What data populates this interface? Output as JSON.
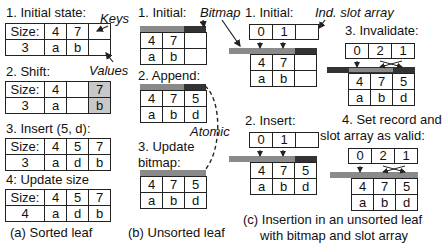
{
  "colors": {
    "bitmap_valid": "#8a8a8a",
    "bitmap_invalid": "#333333",
    "shifted_cell": "#c8c8c8"
  },
  "sorted": {
    "caption": "(a) Sorted leaf",
    "annot_keys": "Keys",
    "annot_values": "Values",
    "steps": [
      {
        "label": "1. Initial state:",
        "size_label": "Size:",
        "size": "3",
        "keys": [
          "4",
          "7",
          ""
        ],
        "values": [
          "a",
          "b",
          ""
        ]
      },
      {
        "label": "2. Shift:",
        "size_label": "Size:",
        "size": "3",
        "keys": [
          "4",
          "",
          "7"
        ],
        "values": [
          "a",
          "",
          "b"
        ]
      },
      {
        "label": "3. Insert (5, d):",
        "size_label": "Size:",
        "size": "3",
        "keys": [
          "4",
          "5",
          "7"
        ],
        "values": [
          "a",
          "d",
          "b"
        ]
      },
      {
        "label": "4: Update size",
        "size_label": "Size:",
        "size": "4",
        "keys": [
          "4",
          "5",
          "7"
        ],
        "values": [
          "a",
          "d",
          "b"
        ]
      }
    ]
  },
  "unsorted": {
    "caption": "(b) Unsorted leaf",
    "annot_bitmap": "Bitmap",
    "annot_atomic": "Atomic",
    "steps": [
      {
        "label": "1. Initial:",
        "keys": [
          "4",
          "7",
          ""
        ],
        "values": [
          "a",
          "b",
          ""
        ]
      },
      {
        "label": "2. Append:",
        "keys": [
          "4",
          "7",
          "5"
        ],
        "values": [
          "a",
          "b",
          "d"
        ]
      },
      {
        "label_line1": "3. Update",
        "label_line2": "bitmap:",
        "keys": [
          "4",
          "7",
          "5"
        ],
        "values": [
          "a",
          "b",
          "d"
        ]
      }
    ]
  },
  "slot": {
    "caption_line1": "(c) Insertion in an unsorted leaf",
    "caption_line2": "with bitmap and slot array",
    "annot_slot": "Ind. slot array",
    "steps": [
      {
        "label": "1. Initial:",
        "slots": [
          "0",
          "1",
          ""
        ],
        "keys": [
          "4",
          "7",
          ""
        ],
        "values": [
          "a",
          "b",
          ""
        ]
      },
      {
        "label": "2. Insert:",
        "slots": [
          "0",
          "1",
          ""
        ],
        "keys": [
          "4",
          "7",
          "5"
        ],
        "values": [
          "a",
          "b",
          "d"
        ]
      },
      {
        "label": "3. Invalidate:",
        "slots": [
          "0",
          "2",
          "1"
        ],
        "keys": [
          "4",
          "7",
          "5"
        ],
        "values": [
          "a",
          "b",
          "d"
        ]
      },
      {
        "label_line1": "4. Set record and",
        "label_line2": "slot array as valid:",
        "slots": [
          "0",
          "2",
          "1"
        ],
        "keys": [
          "4",
          "7",
          "5"
        ],
        "values": [
          "a",
          "b",
          "d"
        ]
      }
    ]
  }
}
